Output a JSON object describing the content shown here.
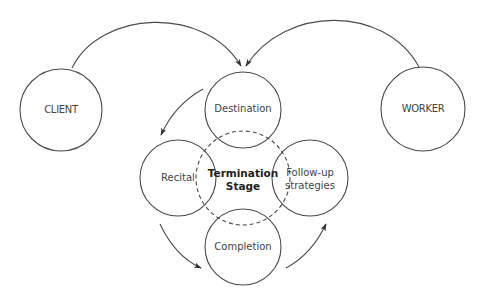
{
  "diagram": {
    "type": "process-cycle",
    "colors": {
      "stroke": "#4a4a4a",
      "text": "#444444",
      "center_text": "#222222",
      "background": "#ffffff"
    },
    "nodes": {
      "client": {
        "label": "CLIENT"
      },
      "worker": {
        "label": "WORKER"
      },
      "destination": {
        "label": "Destination"
      },
      "recital": {
        "label": "Recital"
      },
      "followup": {
        "label_line1": "Follow-up",
        "label_line2": "strategies"
      },
      "completion": {
        "label": "Completion"
      },
      "center": {
        "label_line1": "Termination",
        "label_line2": "Stage",
        "style": "dashed"
      }
    },
    "edges": [
      {
        "from": "CLIENT",
        "to": "Destination"
      },
      {
        "from": "WORKER",
        "to": "Destination"
      },
      {
        "from": "Destination",
        "to": "Recital"
      },
      {
        "from": "Recital",
        "to": "Completion"
      },
      {
        "from": "Completion",
        "to": "Follow-up strategies"
      }
    ]
  }
}
